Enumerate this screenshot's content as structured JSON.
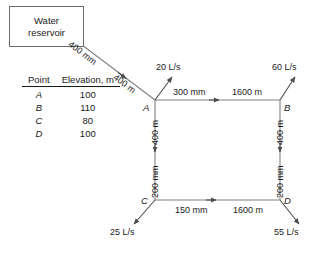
{
  "diagram": {
    "reservoir": {
      "line1": "Water",
      "line2": "reservoir"
    },
    "supply_pipe": {
      "diameter": "400 mm",
      "length": "400 m"
    },
    "nodes": [
      {
        "id": "A",
        "label": "A"
      },
      {
        "id": "B",
        "label": "B"
      },
      {
        "id": "C",
        "label": "C"
      },
      {
        "id": "D",
        "label": "D"
      }
    ],
    "pipes": [
      {
        "id": "AB",
        "diameter": "300 mm",
        "length": "1600 m"
      },
      {
        "id": "AC",
        "diameter": "200 mm",
        "length": "400 m"
      },
      {
        "id": "BD",
        "diameter": "200 mm",
        "length": "400 m"
      },
      {
        "id": "CD",
        "diameter": "150 mm",
        "length": "1600 m"
      }
    ],
    "demands": [
      {
        "node": "A",
        "value": "20 L/s"
      },
      {
        "node": "B",
        "value": "60 L/s"
      },
      {
        "node": "C",
        "value": "25 L/s"
      },
      {
        "node": "D",
        "value": "55 L/s"
      }
    ],
    "table": {
      "headers": [
        "Point",
        "Elevation, m"
      ],
      "rows": [
        {
          "point": "A",
          "elevation": "100"
        },
        {
          "point": "B",
          "elevation": "110"
        },
        {
          "point": "C",
          "elevation": "80"
        },
        {
          "point": "D",
          "elevation": "100"
        }
      ]
    },
    "colors": {
      "line": "#808080",
      "text": "#1a1a1a",
      "box_border": "#6b6b6b"
    }
  }
}
